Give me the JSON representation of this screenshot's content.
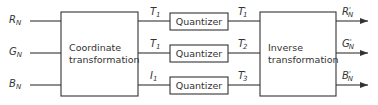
{
  "diagram": {
    "inputs": [
      {
        "symbol": "R",
        "sub": "N"
      },
      {
        "symbol": "G",
        "sub": "N"
      },
      {
        "symbol": "B",
        "sub": "N"
      }
    ],
    "coordinate_box": {
      "line1": "Coordinate",
      "line2": "transformation"
    },
    "intermediate": [
      {
        "symbol": "T",
        "sub": "1"
      },
      {
        "symbol": "T",
        "sub": "1"
      },
      {
        "symbol": "I",
        "sub": "1"
      }
    ],
    "quantizers": [
      {
        "label": "Quantizer"
      },
      {
        "label": "Quantizer"
      },
      {
        "label": "Quantizer"
      }
    ],
    "quantized": [
      {
        "symbol": "T",
        "sub": "1",
        "prime": "'"
      },
      {
        "symbol": "T",
        "sub": "2",
        "prime": "'"
      },
      {
        "symbol": "T",
        "sub": "3",
        "prime": "'"
      }
    ],
    "inverse_box": {
      "line1": "Inverse",
      "line2": "transformation"
    },
    "outputs": [
      {
        "symbol": "R",
        "sub": "N",
        "prime": "'"
      },
      {
        "symbol": "G",
        "sub": "N",
        "prime": "'"
      },
      {
        "symbol": "B",
        "sub": "N",
        "prime": "'"
      }
    ],
    "colors": {
      "line": "#333333",
      "text": "#333333",
      "background": "#ffffff"
    }
  }
}
